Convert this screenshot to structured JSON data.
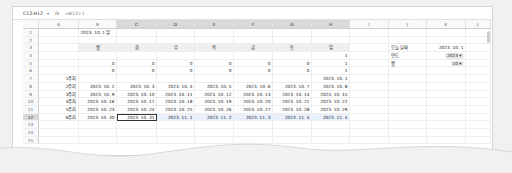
{
  "formula_bar": {
    "name_box": "C12:H12",
    "fx_icon": "fx",
    "formula": "=B12+1"
  },
  "columns": [
    "A",
    "B",
    "C",
    "D",
    "E",
    "F",
    "G",
    "H",
    "I",
    "J",
    "K",
    "L"
  ],
  "column_widths": [
    40,
    38,
    40,
    38,
    39,
    39,
    39,
    38,
    39,
    38,
    39,
    25
  ],
  "selected_columns": [
    "C",
    "D",
    "E",
    "F",
    "G",
    "H"
  ],
  "rows": [
    {
      "n": "1",
      "cells": {
        "B": "2023. 10. 1 일"
      }
    },
    {
      "n": "2",
      "cells": {}
    },
    {
      "n": "3",
      "cells": {
        "B": "월",
        "C": "화",
        "D": "수",
        "E": "목",
        "F": "금",
        "G": "토",
        "H": "일",
        "J": "오늘 날짜",
        "K": "2023. 10. 1"
      }
    },
    {
      "n": "4",
      "cells": {
        "H": "1",
        "J": "연도",
        "K": "2023 ▾"
      }
    },
    {
      "n": "5",
      "cells": {
        "B": "0",
        "C": "0",
        "D": "0",
        "E": "0",
        "F": "0",
        "G": "0",
        "H": "1",
        "J": "월",
        "K": "10 ▾"
      }
    },
    {
      "n": "6",
      "cells": {
        "B": "0",
        "C": "0",
        "D": "0",
        "E": "0",
        "F": "0",
        "G": "0",
        "H": "1"
      }
    },
    {
      "n": "7",
      "cells": {
        "A": "1주차",
        "H": "2023. 10. 1"
      }
    },
    {
      "n": "8",
      "cells": {
        "A": "2주차",
        "B": "2023. 10. 2",
        "C": "2023. 10. 3",
        "D": "2023. 10. 4",
        "E": "2023. 10. 5",
        "F": "2023. 10. 6",
        "G": "2023. 10. 7",
        "H": "2023. 10. 8"
      }
    },
    {
      "n": "9",
      "cells": {
        "A": "3주차",
        "B": "2023. 10. 9",
        "C": "2023. 10. 10",
        "D": "2023. 10. 11",
        "E": "2023. 10. 12",
        "F": "2023. 10. 13",
        "G": "2023. 10. 14",
        "H": "2023. 10. 15"
      }
    },
    {
      "n": "10",
      "cells": {
        "A": "4주차",
        "B": "2023. 10. 16",
        "C": "2023. 10. 17",
        "D": "2023. 10. 18",
        "E": "2023. 10. 19",
        "F": "2023. 10. 20",
        "G": "2023. 10. 21",
        "H": "2023. 10. 22"
      }
    },
    {
      "n": "11",
      "cells": {
        "A": "5주차",
        "B": "2023. 10. 23",
        "C": "2023. 10. 24",
        "D": "2023. 10. 25",
        "E": "2023. 10. 26",
        "F": "2023. 10. 27",
        "G": "2023. 10. 28",
        "H": "2023. 10. 29"
      }
    },
    {
      "n": "12",
      "cells": {
        "A": "6주차",
        "B": "2023. 10. 30",
        "C": "2023. 10. 31",
        "D": "2023. 11. 1",
        "E": "2023. 11. 2",
        "F": "2023. 11. 3",
        "G": "2023. 11. 4",
        "H": "2023. 11. 5"
      }
    },
    {
      "n": "13",
      "cells": {}
    },
    {
      "n": "14",
      "cells": {}
    },
    {
      "n": "15",
      "cells": {}
    }
  ],
  "selection": {
    "row": "12",
    "range": "C12:H12",
    "active": "C12"
  },
  "colors": {
    "header_gray": "#efefef",
    "selection_fill": "#e8f0fe",
    "active_border": "#333333",
    "grid": "#eeeeee"
  }
}
